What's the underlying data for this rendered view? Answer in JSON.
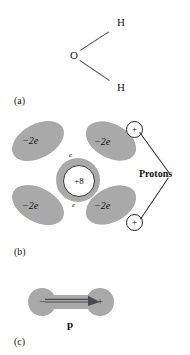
{
  "figure": {
    "panels": [
      {
        "id": "a",
        "label": "(a)",
        "title": "water-molecule-structure",
        "atoms": [
          {
            "symbol": "O",
            "x": 70,
            "y": 52
          },
          {
            "symbol": "H",
            "x": 118,
            "y": 22
          },
          {
            "symbol": "H",
            "x": 118,
            "y": 85
          }
        ]
      },
      {
        "id": "b",
        "label": "(b)",
        "title": "charge-distribution",
        "lobes": [
          {
            "name": "upper-left-electron-pair",
            "charge": "−2e"
          },
          {
            "name": "upper-right-electron-pair",
            "charge": "−2e"
          },
          {
            "name": "lower-left-electron-pair",
            "charge": "−2e"
          },
          {
            "name": "lower-right-electron-pair",
            "charge": "−2e"
          }
        ],
        "nucleus": {
          "charge": "+8"
        },
        "bonding_electrons": [
          {
            "name": "upper-bonding-electron",
            "label": "e"
          },
          {
            "name": "lower-bonding-electron",
            "label": "e"
          }
        ],
        "protons": [
          {
            "name": "upper-proton",
            "sign": "+"
          },
          {
            "name": "lower-proton",
            "sign": "+"
          }
        ],
        "callout": "Protons"
      },
      {
        "id": "c",
        "label": "(c)",
        "title": "dipole-moment",
        "negative_sign": "−",
        "positive_sign": "+",
        "vector_label": "p"
      }
    ],
    "colors": {
      "gray_fill": "#a9a9a9",
      "ink": "#1a1a1a",
      "outline": "#2a2a2a",
      "background": "#ffffff"
    }
  }
}
